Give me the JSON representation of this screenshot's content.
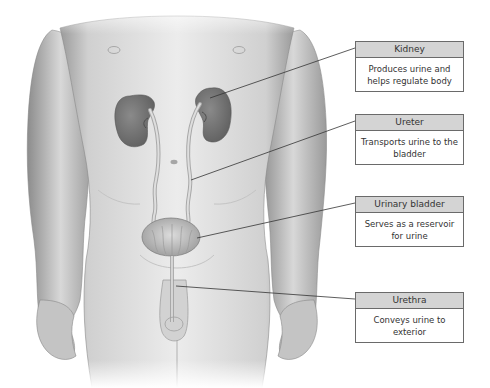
{
  "diagram": {
    "labels": [
      {
        "id": "kidney",
        "title": "Kidney",
        "description": "Produces urine and helps regulate body",
        "top": 41,
        "height": 51
      },
      {
        "id": "ureter",
        "title": "Ureter",
        "description": "Transports urine to the bladder",
        "top": 114,
        "height": 51
      },
      {
        "id": "urinary-bladder",
        "title": "Urinary bladder",
        "description": "Serves as a reservoir for urine",
        "top": 196,
        "height": 51
      },
      {
        "id": "urethra",
        "title": "Urethra",
        "description": "Conveys urine to exterior",
        "top": 292,
        "height": 51
      }
    ]
  },
  "colors": {
    "header_fill": "#d4d4d4",
    "box_border": "#6a6a6a",
    "skin": "#e6e6e6",
    "skin_shadow": "#9a9a9a",
    "kidney": "#777777",
    "leader_line": "#333333"
  }
}
